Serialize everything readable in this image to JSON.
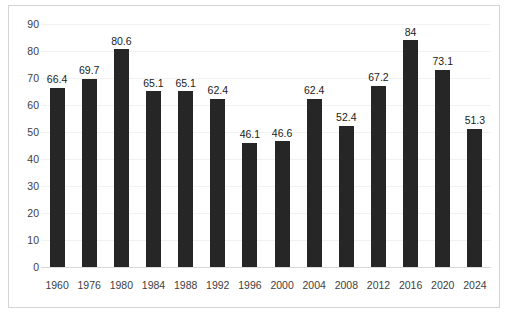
{
  "chart_data": {
    "type": "bar",
    "title": "",
    "subtitle": "",
    "xlabel": "",
    "ylabel": "",
    "categories": [
      "1960",
      "1976",
      "1980",
      "1984",
      "1988",
      "1992",
      "1996",
      "2000",
      "2004",
      "2008",
      "2012",
      "2016",
      "2020",
      "2024"
    ],
    "values": [
      66.4,
      69.7,
      80.6,
      65.1,
      65.1,
      62.4,
      46.1,
      46.6,
      62.4,
      52.4,
      67.2,
      84,
      73.1,
      51.3
    ],
    "value_labels": [
      "66.4",
      "69.7",
      "80.6",
      "65.1",
      "65.1",
      "62.4",
      "46.1",
      "46.6",
      "62.4",
      "52.4",
      "67.2",
      "84",
      "73.1",
      "51.3"
    ],
    "ylim": [
      0,
      90
    ],
    "ytick_step": 10,
    "ytick_labels": [
      "90",
      "80",
      "70",
      "60",
      "50",
      "40",
      "30",
      "20",
      "10",
      "0"
    ],
    "ytick_values": [
      90,
      80,
      70,
      60,
      50,
      40,
      30,
      20,
      10,
      0
    ],
    "grid": true,
    "legend": null,
    "legend_position": "none",
    "bar_color": "#262626",
    "gridline_color": "#f2f2f2",
    "axis_color": "#d9d9d9",
    "border_color": "#d4d4d4",
    "background_color": "#ffffff",
    "tick_label_color": "#404040",
    "data_label_color": "#1a1a1a"
  }
}
